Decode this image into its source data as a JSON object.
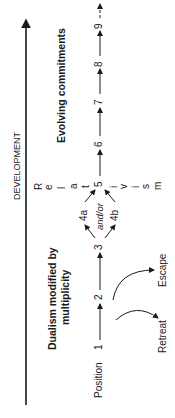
{
  "diagram": {
    "axis_label": "DEVELOPMENT",
    "phases": {
      "early": "Dualism modified by",
      "early_line2": "multiplicity",
      "late": "Evolving commitments"
    },
    "relativism_letters": [
      "R",
      "e",
      "l",
      "a",
      "t",
      "i",
      "v",
      "i",
      "s",
      "m"
    ],
    "relativism_word": "Relativism",
    "position_label": "Position",
    "positions": [
      "1",
      "2",
      "3",
      "4a",
      "4b",
      "5",
      "6",
      "7",
      "8",
      "9"
    ],
    "branch_connector": "and/or",
    "deflections": {
      "retreat": "Retreat",
      "escape": "Escape"
    },
    "colors": {
      "ink": "#1a1a1a",
      "background": "#ffffff"
    }
  }
}
